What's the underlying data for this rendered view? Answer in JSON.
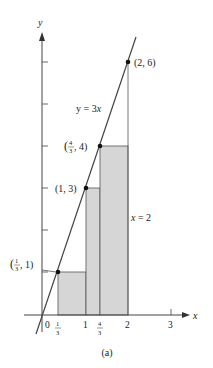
{
  "figure": {
    "caption": "(a)",
    "axes": {
      "x_label": "x",
      "y_label": "y",
      "x_ticks": [
        {
          "value": 0,
          "label": "0"
        },
        {
          "value": 0.3333,
          "label_num": "1",
          "label_den": "3"
        },
        {
          "value": 1,
          "label": "1"
        },
        {
          "value": 1.3333,
          "label_num": "4",
          "label_den": "3"
        },
        {
          "value": 2,
          "label": "2"
        },
        {
          "value": 3,
          "label": "3"
        }
      ],
      "y_ticks": [
        1,
        2,
        3,
        4,
        5,
        6
      ]
    },
    "line": {
      "equation": "y = 3x",
      "label_lhs": "y = 3",
      "label_var": "x"
    },
    "vertical_line": {
      "label_var": "x",
      "label_rest": " = 2"
    },
    "points": [
      {
        "x": 0.3333,
        "y": 1,
        "label_pre": "(",
        "label_num": "1",
        "label_den": "3",
        "label_post": ", 1)"
      },
      {
        "x": 1,
        "y": 3,
        "label": "(1, 3)"
      },
      {
        "x": 1.3333,
        "y": 4,
        "label_pre": "(",
        "label_num": "4",
        "label_den": "3",
        "label_post": ", 4)"
      },
      {
        "x": 2,
        "y": 6,
        "label": "(2, 6)"
      }
    ],
    "rectangles": [
      {
        "x0": 0.3333,
        "x1": 1,
        "height": 1
      },
      {
        "x0": 1,
        "x1": 1.3333,
        "height": 3
      },
      {
        "x0": 1.3333,
        "x1": 2,
        "height": 4
      }
    ],
    "colors": {
      "fill": "#d6d6d6",
      "stroke": "#444444"
    }
  }
}
